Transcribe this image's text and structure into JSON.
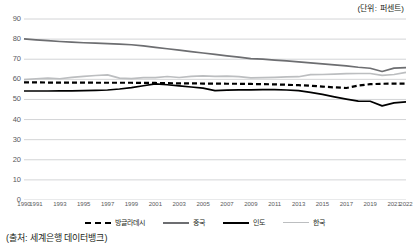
{
  "unit_note": "(단위: 퍼센트)",
  "source_note": "(출처: 세계은행 데이터뱅크)",
  "legend": {
    "items": [
      {
        "label": "방글라데시",
        "color": "#000000",
        "style": "dashed"
      },
      {
        "label": "중국",
        "color": "#6d6e71",
        "style": "solid"
      },
      {
        "label": "인도",
        "color": "#000000",
        "style": "solid"
      },
      {
        "label": "한국",
        "color": "#bcbec0",
        "style": "solid"
      }
    ]
  },
  "chart_data": {
    "type": "line",
    "title": "",
    "subtitle": "",
    "xlabel": "",
    "ylabel": "",
    "unit": "퍼센트",
    "source": "세계은행 데이터뱅크",
    "grid": true,
    "legend_position": "bottom",
    "ylim": [
      0,
      90
    ],
    "yticks": [
      0,
      10,
      20,
      30,
      40,
      50,
      60,
      70,
      80,
      90
    ],
    "xlim": [
      1990,
      2022
    ],
    "xticks": [
      1990,
      1991,
      1993,
      1995,
      1997,
      1999,
      2001,
      2003,
      2005,
      2007,
      2009,
      2011,
      2013,
      2015,
      2017,
      2019,
      2021,
      2022
    ],
    "x": [
      1990,
      1991,
      1992,
      1993,
      1994,
      1995,
      1996,
      1997,
      1998,
      1999,
      2000,
      2001,
      2002,
      2003,
      2004,
      2005,
      2006,
      2007,
      2008,
      2009,
      2010,
      2011,
      2012,
      2013,
      2014,
      2015,
      2016,
      2017,
      2018,
      2019,
      2020,
      2021,
      2022
    ],
    "series": [
      {
        "name": "방글라데시",
        "color": "#000000",
        "style": "dashed",
        "values": [
          58.5,
          58.5,
          58.4,
          58.4,
          58.4,
          58.4,
          58.3,
          58.3,
          58.3,
          58.3,
          58.2,
          58.2,
          58.1,
          58.0,
          58.0,
          57.9,
          57.9,
          57.8,
          57.8,
          57.7,
          57.6,
          57.5,
          57.3,
          57.1,
          56.8,
          56.4,
          56.0,
          55.7,
          56.9,
          57.6,
          57.8,
          57.9,
          57.9
        ]
      },
      {
        "name": "중국",
        "color": "#6d6e71",
        "style": "solid",
        "values": [
          80.1,
          79.6,
          79.2,
          78.8,
          78.5,
          78.2,
          78.0,
          77.8,
          77.5,
          77.2,
          76.6,
          75.9,
          75.2,
          74.5,
          73.8,
          73.1,
          72.4,
          71.7,
          71.0,
          70.3,
          70.0,
          69.6,
          69.2,
          68.7,
          68.2,
          67.7,
          67.2,
          66.7,
          66.0,
          65.5,
          63.9,
          65.6,
          65.8
        ]
      },
      {
        "name": "인도",
        "color": "#000000",
        "style": "solid",
        "values": [
          54.2,
          54.2,
          54.2,
          54.3,
          54.3,
          54.4,
          54.5,
          54.7,
          55.2,
          55.9,
          56.8,
          57.7,
          57.3,
          56.7,
          56.2,
          55.6,
          54.4,
          54.6,
          54.8,
          54.8,
          54.9,
          54.9,
          54.7,
          54.4,
          53.5,
          52.5,
          51.3,
          50.2,
          49.2,
          49.1,
          46.8,
          48.3,
          48.8
        ]
      },
      {
        "name": "한국",
        "color": "#bcbec0",
        "style": "solid",
        "values": [
          59.9,
          60.3,
          60.6,
          60.3,
          61.0,
          61.5,
          61.9,
          62.2,
          60.6,
          60.4,
          60.8,
          60.8,
          61.4,
          60.9,
          61.5,
          61.7,
          61.5,
          61.6,
          61.3,
          60.7,
          60.8,
          61.0,
          61.2,
          61.3,
          62.3,
          62.4,
          62.6,
          62.8,
          62.9,
          62.9,
          62.0,
          62.4,
          63.5
        ]
      }
    ]
  }
}
